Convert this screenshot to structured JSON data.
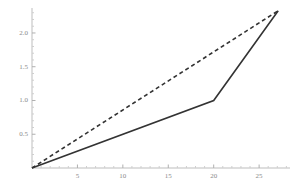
{
  "chart_data": {
    "type": "line",
    "title": "",
    "subtitle": "",
    "xlabel": "",
    "ylabel": "",
    "xlim": [
      0,
      28.4
    ],
    "ylim": [
      0,
      2.37
    ],
    "grid": false,
    "legend": null,
    "legend_position": "none",
    "x_ticks": [
      5,
      10,
      15,
      20,
      25
    ],
    "x_tick_labels": [
      "5",
      "10",
      "15",
      "20",
      "25"
    ],
    "x_minor_tick_step": 1,
    "y_ticks": [
      0.5,
      1.0,
      1.5,
      2.0
    ],
    "y_tick_labels": [
      "0.5",
      "1.0",
      "1.5",
      "2.0"
    ],
    "y_minor_tick_step": 0.1,
    "axis_color": "#b8b8b8",
    "series": [
      {
        "name": "solid-line",
        "style": "solid",
        "color": "#333333",
        "width": 1.6,
        "x": [
          0,
          20,
          27.1
        ],
        "y": [
          0,
          1.0,
          2.33
        ]
      },
      {
        "name": "dashed-line",
        "style": "dashed",
        "color": "#333333",
        "width": 1.6,
        "dash": "4 3",
        "x": [
          0,
          27.1
        ],
        "y": [
          0,
          2.33
        ]
      }
    ]
  }
}
